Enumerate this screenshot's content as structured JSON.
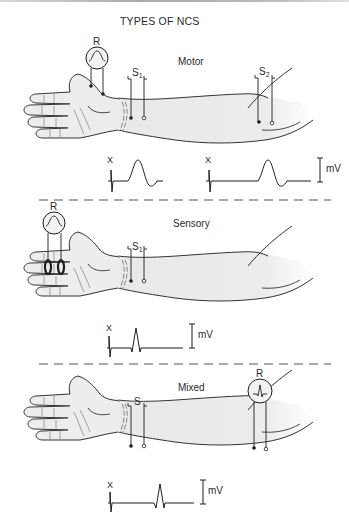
{
  "title": "TYPES OF NCS",
  "panels": [
    {
      "name": "Motor",
      "recording_label": "R",
      "stimulation_sites": [
        {
          "label": "S",
          "subscript": "1",
          "location": "wrist"
        },
        {
          "label": "S",
          "subscript": "2",
          "location": "elbow"
        }
      ],
      "traces": [
        {
          "stimulus_marker": "X",
          "response": "CMAP (large biphasic)"
        },
        {
          "stimulus_marker": "X",
          "response": "CMAP (delayed)"
        }
      ],
      "scale_label": "mV"
    },
    {
      "name": "Sensory",
      "recording_label": "R",
      "recording_type": "ring electrodes on finger",
      "stimulation_sites": [
        {
          "label": "S",
          "subscript": "1",
          "location": "wrist"
        }
      ],
      "traces": [
        {
          "stimulus_marker": "X",
          "response": "SNAP (small sharp)"
        }
      ],
      "scale_label": "mV"
    },
    {
      "name": "Mixed",
      "recording_label": "R",
      "stimulation_sites": [
        {
          "label": "S",
          "subscript": "",
          "location": "wrist"
        }
      ],
      "traces": [
        {
          "stimulus_marker": "X",
          "response": "mixed nerve action potential"
        }
      ],
      "scale_label": "mV"
    }
  ],
  "colors": {
    "line": "#1e1e1e",
    "skin": "#ececec",
    "dash": "#555555",
    "text": "#2a2a2a"
  }
}
